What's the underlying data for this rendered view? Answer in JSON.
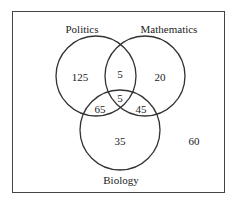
{
  "diagram": {
    "type": "venn",
    "sets": [
      {
        "name": "Politics",
        "label": "Politics"
      },
      {
        "name": "Mathematics",
        "label": "Mathematics"
      },
      {
        "name": "Biology",
        "label": "Biology"
      }
    ],
    "regions": {
      "politics_only": "125",
      "mathematics_only": "20",
      "biology_only": "35",
      "politics_mathematics_only": "5",
      "politics_biology_only": "65",
      "mathematics_biology_only": "45",
      "all_three": "5",
      "none": "60"
    },
    "colors": {
      "stroke": "#333333",
      "frame": "#444444",
      "text": "#222222"
    }
  }
}
